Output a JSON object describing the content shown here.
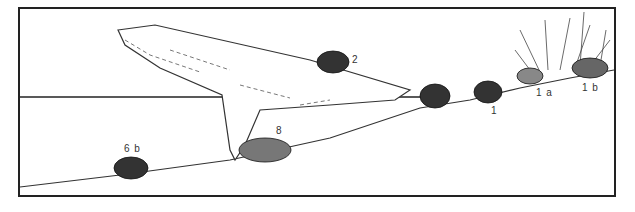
{
  "illustration": {
    "subject": "turtles on a log and shore",
    "labels": {
      "turtle_2": "2",
      "turtle_1": "1",
      "turtle_1a": "1 a",
      "turtle_1b": "1 b",
      "turtle_8": "8",
      "turtle_6b": "6 b"
    },
    "colors": {
      "ink": "#222222",
      "background": "#ffffff"
    }
  }
}
